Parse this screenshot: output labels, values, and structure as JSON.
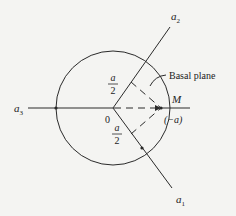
{
  "diagram": {
    "type": "hexagonal-axes-basal-plane",
    "center_label": "0",
    "axes": [
      {
        "id": "a1",
        "label": "a",
        "subscript": "1"
      },
      {
        "id": "a2",
        "label": "a",
        "subscript": "2"
      },
      {
        "id": "a3",
        "label": "a",
        "subscript": "3"
      }
    ],
    "half_labels": [
      {
        "numerator": "a",
        "denominator": "2"
      },
      {
        "numerator": "a",
        "denominator": "2"
      }
    ],
    "point_M": {
      "label": "M",
      "sub_label": "(−a)"
    },
    "callout": "Basal plane",
    "colors": {
      "line": "#2a2a2a",
      "background": "#f4f4f2"
    }
  }
}
